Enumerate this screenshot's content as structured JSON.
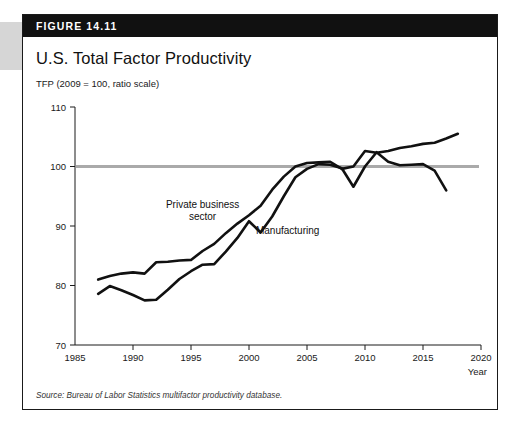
{
  "figure": {
    "banner_label": "FIGURE 14.11",
    "title": "U.S. Total Factor Productivity",
    "axis_note": "TFP (2009 = 100, ratio scale)",
    "source": "Source: Bureau of Labor Statistics multifactor productivity database."
  },
  "colors": {
    "banner_bg": "#111111",
    "card_border": "#1a1a1a",
    "line": "#111111",
    "reference_line": "#aaaaaa",
    "tab": "#d6d6d6"
  },
  "chart_data": {
    "type": "line",
    "title": "U.S. Total Factor Productivity",
    "subtitle": "TFP (2009 = 100, ratio scale)",
    "xlabel": "Year",
    "ylabel": "TFP (2009 = 100, ratio scale)",
    "xlim": [
      1985,
      2020
    ],
    "ylim": [
      70,
      110
    ],
    "xticks": [
      1985,
      1990,
      1995,
      2000,
      2005,
      2010,
      2015,
      2020
    ],
    "yticks": [
      70,
      80,
      90,
      100,
      110
    ],
    "grid": false,
    "legend_position": "inline-annotation",
    "reference_line": {
      "y": 100,
      "label": "2009 = 100"
    },
    "annotations": [
      {
        "text": "Private business sector",
        "x": 1996.0,
        "y": 93.0
      },
      {
        "text": "Manufacturing",
        "x": 2000.6,
        "y": 88.6
      }
    ],
    "series": [
      {
        "name": "Private business sector",
        "x": [
          1987,
          1988,
          1989,
          1990,
          1991,
          1992,
          1993,
          1994,
          1995,
          1996,
          1997,
          1998,
          1999,
          2000,
          2001,
          2002,
          2003,
          2004,
          2005,
          2006,
          2007,
          2008,
          2009,
          2010,
          2011,
          2012,
          2013,
          2014,
          2015,
          2016,
          2017,
          2018
        ],
        "values": [
          81.0,
          81.6,
          82.0,
          82.2,
          82.0,
          83.9,
          84.0,
          84.2,
          84.3,
          85.8,
          87.0,
          88.8,
          90.4,
          91.8,
          93.4,
          96.1,
          98.3,
          100.0,
          100.6,
          100.7,
          100.8,
          99.6,
          100.0,
          102.6,
          102.3,
          102.6,
          103.1,
          103.4,
          103.8,
          104.0,
          104.7,
          105.5
        ]
      },
      {
        "name": "Manufacturing",
        "x": [
          1987,
          1988,
          1989,
          1990,
          1991,
          1992,
          1993,
          1994,
          1995,
          1996,
          1997,
          1998,
          1999,
          2000,
          2001,
          2002,
          2003,
          2004,
          2005,
          2006,
          2007,
          2008,
          2009,
          2010,
          2011,
          2012,
          2013,
          2014,
          2015,
          2016,
          2017
        ],
        "values": [
          78.6,
          79.9,
          79.2,
          78.4,
          77.5,
          77.6,
          79.3,
          81.1,
          82.4,
          83.5,
          83.6,
          85.7,
          88.0,
          90.8,
          88.9,
          91.6,
          95.0,
          98.2,
          99.6,
          100.4,
          100.3,
          99.7,
          96.6,
          100.0,
          102.4,
          100.8,
          100.2,
          100.3,
          100.4,
          99.3,
          96.0
        ]
      }
    ]
  }
}
